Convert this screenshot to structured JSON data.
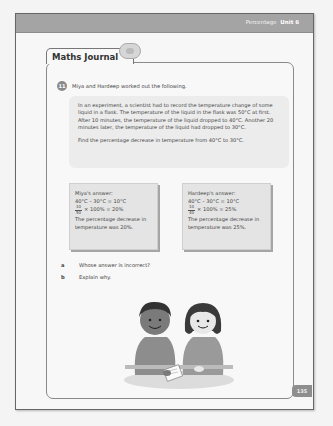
{
  "header": {
    "section": "Percentage",
    "unit": "Unit 6"
  },
  "journal": {
    "title": "Maths Journal",
    "question_number": "11",
    "intro": "Miya and Hardeep worked out the following.",
    "problem": {
      "paragraph1": "In an experiment, a scientist had to record the temperature change of some liquid in a flask. The temperature of the liquid in the flask was 50°C at first. After 10 minutes, the temperature of the liquid dropped to 40°C. Another 20 minutes later, the temperature of the liquid had dropped to 30°C.",
      "paragraph2": "Find the percentage decrease in temperature from 40°C to 30°C."
    },
    "answers": [
      {
        "name": "Miya's answer:",
        "step1": "40°C – 30°C = 10°C",
        "frac_num": "10",
        "frac_den": "50",
        "step2": "× 100% = 20%",
        "conclusion": "The percentage decrease in temperature was 20%."
      },
      {
        "name": "Hardeep's answer:",
        "step1": "40°C – 30°C = 10°C",
        "frac_num": "10",
        "frac_den": "40",
        "step2": "× 100% = 25%",
        "conclusion": "The percentage decrease in temperature was 25%."
      }
    ],
    "sub_questions": [
      {
        "label": "a",
        "text": "Whose answer is incorrect?"
      },
      {
        "label": "b",
        "text": "Explain why."
      }
    ]
  },
  "illustration": {
    "description": "two-children-sharing-worksheet"
  },
  "footer": {
    "page_number": "135"
  }
}
